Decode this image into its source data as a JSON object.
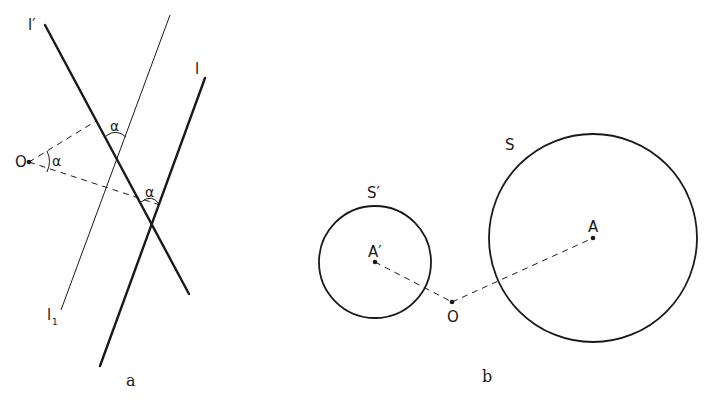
{
  "figure": {
    "panel_a": {
      "caption": "a",
      "labels": {
        "l_prime": "l′",
        "l": "l",
        "l1_main": "l",
        "l1_sub": "1",
        "center": "O",
        "angle_at_O": "α",
        "angle_top": "α",
        "angle_bottom": "α"
      }
    },
    "panel_b": {
      "caption": "b",
      "labels": {
        "circle_small": "S′",
        "circle_large": "S",
        "center_small": "A′",
        "center_large": "A",
        "center": "O"
      }
    }
  }
}
